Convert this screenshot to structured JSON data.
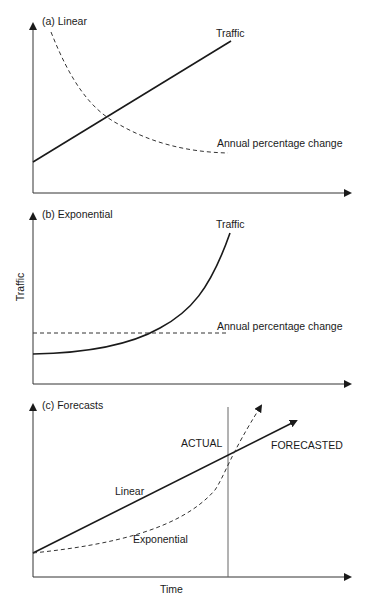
{
  "panels": [
    {
      "id": "a",
      "title": "(a) Linear",
      "curves": [
        {
          "name": "Traffic",
          "style": "solid",
          "shape": "linear"
        },
        {
          "name": "Annual percentage change",
          "style": "dashed",
          "shape": "decreasing"
        }
      ],
      "labels": {
        "traffic": "Traffic",
        "apc": "Annual percentage change"
      }
    },
    {
      "id": "b",
      "title": "(b) Exponential",
      "curves": [
        {
          "name": "Traffic",
          "style": "solid",
          "shape": "exponential"
        },
        {
          "name": "Annual percentage change",
          "style": "dashed",
          "shape": "constant"
        }
      ],
      "labels": {
        "traffic": "Traffic",
        "apc": "Annual percentage change"
      }
    },
    {
      "id": "c",
      "title": "(c) Forecasts",
      "curves": [
        {
          "name": "Linear",
          "style": "solid",
          "shape": "linear"
        },
        {
          "name": "Exponential",
          "style": "dashed",
          "shape": "exponential"
        }
      ],
      "labels": {
        "linear": "Linear",
        "exponential": "Exponential",
        "actual": "ACTUAL",
        "forecasted": "FORECASTED"
      }
    }
  ],
  "axes": {
    "ylabel": "Traffic",
    "xlabel": "Time"
  },
  "colors": {
    "line": "#1a1a1a",
    "axis": "#333333",
    "divider": "#666666"
  }
}
